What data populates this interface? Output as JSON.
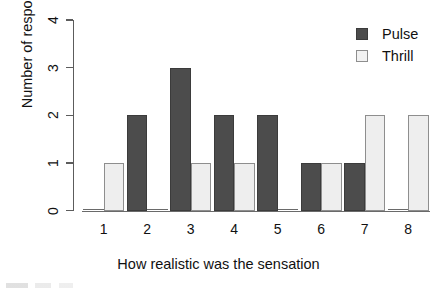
{
  "chart_data": {
    "type": "bar",
    "title": "",
    "xlabel": "How realistic was the sensation",
    "ylabel": "Number of responses",
    "categories": [
      "1",
      "2",
      "3",
      "4",
      "5",
      "6",
      "7",
      "8"
    ],
    "series": [
      {
        "name": "Pulse",
        "color": "#4c4c4c",
        "values": [
          0,
          2,
          3,
          2,
          2,
          1,
          1,
          0
        ]
      },
      {
        "name": "Thrill",
        "color": "#eeeeee",
        "values": [
          1,
          0,
          1,
          1,
          0,
          1,
          2,
          2
        ]
      }
    ],
    "ylim": [
      0,
      4
    ],
    "yticks": [
      "0",
      "1",
      "2",
      "3",
      "4"
    ],
    "grid": false,
    "legend_position": "top-right",
    "grouping": "dodged"
  },
  "legend": {
    "items": [
      {
        "label": "Pulse"
      },
      {
        "label": "Thrill"
      }
    ]
  }
}
